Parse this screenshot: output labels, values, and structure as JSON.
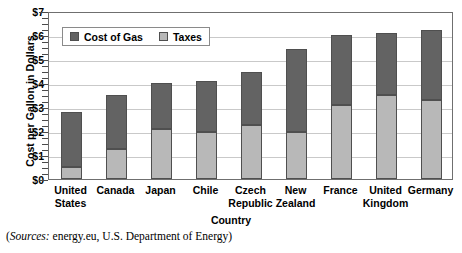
{
  "chart_data": {
    "type": "bar",
    "stacked": true,
    "title": "",
    "xlabel": "Country",
    "ylabel": "Cost per Gallon in Dollars",
    "categories": [
      "United States",
      "Canada",
      "Japan",
      "Chile",
      "Czech Republic",
      "New Zealand",
      "France",
      "United Kingdom",
      "Germany"
    ],
    "category_lines": [
      [
        "United",
        "States"
      ],
      [
        "Canada",
        ""
      ],
      [
        "Japan",
        ""
      ],
      [
        "Chile",
        ""
      ],
      [
        "Czech",
        "Republic"
      ],
      [
        "New",
        "Zealand"
      ],
      [
        "France",
        ""
      ],
      [
        "United",
        "Kingdom"
      ],
      [
        "Germany",
        ""
      ]
    ],
    "series": [
      {
        "name": "Taxes",
        "color": "#b8b8b8",
        "values": [
          0.5,
          1.25,
          2.1,
          1.95,
          2.25,
          1.95,
          3.1,
          3.5,
          3.3
        ]
      },
      {
        "name": "Cost of Gas",
        "color": "#636363",
        "values": [
          2.3,
          2.25,
          1.9,
          2.15,
          2.2,
          3.45,
          2.9,
          2.6,
          2.9
        ]
      }
    ],
    "totals": [
      2.8,
      3.5,
      4.0,
      4.1,
      4.45,
      5.4,
      6.0,
      6.1,
      6.2
    ],
    "legend": [
      "Cost of Gas",
      "Taxes"
    ],
    "legend_position": "upper-left-inside",
    "ylim": [
      0,
      7
    ],
    "yticks": [
      0,
      1,
      2,
      3,
      4,
      5,
      6,
      7
    ],
    "ytick_labels": [
      "$0",
      "$1",
      "$2",
      "$3",
      "$4",
      "$5",
      "$6",
      "$7"
    ],
    "yminor_step": 0.25,
    "grid": "horizontal"
  },
  "source_note": {
    "prefix": "(",
    "italic": "Sources:",
    "text": " energy.eu, U.S. Department of Energy)"
  }
}
